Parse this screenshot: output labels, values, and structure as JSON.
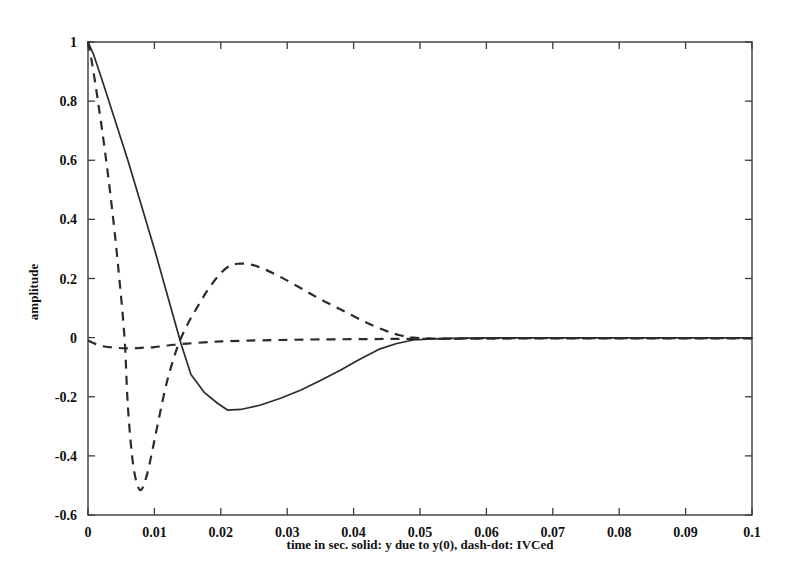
{
  "chart_data": {
    "type": "line",
    "title": "",
    "xlabel": "time in sec. solid: y due to y(0), dash-dot: IVCed",
    "ylabel": "amplitude",
    "xlim": [
      0,
      0.1
    ],
    "ylim": [
      -0.6,
      1
    ],
    "xticks": [
      0,
      0.01,
      0.02,
      0.03,
      0.04,
      0.05,
      0.06,
      0.07,
      0.08,
      0.09,
      0.1
    ],
    "xticklabels": [
      "0",
      "0.01",
      "0.02",
      "0.03",
      "0.04",
      "0.05",
      "0.06",
      "0.07",
      "0.08",
      "0.09",
      "0.1"
    ],
    "yticks": [
      -0.6,
      -0.4,
      -0.2,
      0,
      0.2,
      0.4,
      0.6,
      0.8,
      1
    ],
    "yticklabels": [
      "-0.6",
      "-0.4",
      "-0.2",
      "0",
      "0.2",
      "0.4",
      "0.6",
      "0.8",
      "1"
    ],
    "grid": false,
    "legend": "none",
    "box": true,
    "series": [
      {
        "name": "y due to y(0)",
        "style": "solid",
        "x": [
          0.0,
          0.0008,
          0.002,
          0.004,
          0.006,
          0.008,
          0.01,
          0.012,
          0.014,
          0.0155,
          0.0175,
          0.0195,
          0.021,
          0.023,
          0.026,
          0.029,
          0.032,
          0.035,
          0.038,
          0.041,
          0.044,
          0.0465,
          0.049,
          0.052,
          0.056,
          0.062,
          0.07,
          0.08,
          0.09,
          0.1
        ],
        "y": [
          1.0,
          0.96,
          0.88,
          0.74,
          0.6,
          0.45,
          0.3,
          0.14,
          -0.02,
          -0.125,
          -0.185,
          -0.222,
          -0.245,
          -0.243,
          -0.228,
          -0.205,
          -0.178,
          -0.145,
          -0.11,
          -0.072,
          -0.038,
          -0.02,
          -0.008,
          -0.004,
          -0.002,
          -0.001,
          -0.001,
          -0.001,
          -0.001,
          -0.001
        ]
      },
      {
        "name": "IVCed",
        "style": "dashed",
        "x": [
          0.0,
          0.0006,
          0.0015,
          0.0025,
          0.0035,
          0.0045,
          0.0055,
          0.006,
          0.0068,
          0.0078,
          0.0088,
          0.0098,
          0.0108,
          0.012,
          0.0135,
          0.015,
          0.0165,
          0.018,
          0.0195,
          0.021,
          0.0225,
          0.0245,
          0.0265,
          0.029,
          0.032,
          0.035,
          0.0385,
          0.042,
          0.045,
          0.047,
          0.049,
          0.052,
          0.056,
          0.062,
          0.07,
          0.08,
          0.09,
          0.1
        ],
        "y": [
          1.0,
          0.93,
          0.8,
          0.64,
          0.46,
          0.25,
          0.0,
          -0.23,
          -0.43,
          -0.515,
          -0.47,
          -0.37,
          -0.26,
          -0.14,
          -0.03,
          0.045,
          0.105,
          0.16,
          0.205,
          0.238,
          0.25,
          0.247,
          0.232,
          0.205,
          0.168,
          0.13,
          0.09,
          0.05,
          0.022,
          0.008,
          0.0,
          -0.003,
          -0.003,
          -0.002,
          -0.002,
          -0.002,
          -0.002,
          -0.002
        ]
      },
      {
        "name": "near-zero",
        "style": "dashed",
        "x": [
          0.0,
          0.0012,
          0.0025,
          0.004,
          0.0055,
          0.007,
          0.0085,
          0.01,
          0.0115,
          0.013,
          0.015,
          0.0175,
          0.02,
          0.024,
          0.029,
          0.035,
          0.042,
          0.048,
          0.055,
          0.064,
          0.074,
          0.085,
          0.095,
          0.1
        ],
        "y": [
          -0.01,
          -0.022,
          -0.03,
          -0.034,
          -0.036,
          -0.036,
          -0.034,
          -0.032,
          -0.028,
          -0.024,
          -0.02,
          -0.016,
          -0.013,
          -0.01,
          -0.008,
          -0.006,
          -0.005,
          -0.004,
          -0.004,
          -0.003,
          -0.003,
          -0.003,
          -0.003,
          -0.003
        ]
      }
    ]
  }
}
